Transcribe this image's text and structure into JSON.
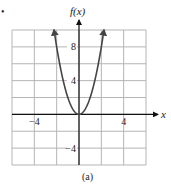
{
  "chart_data": {
    "type": "line",
    "title": "",
    "caption": "(a)",
    "xlabel": "x",
    "ylabel": "f(x)",
    "function": "f(x) = 2x^2",
    "xlim": [
      -6,
      6
    ],
    "ylim": [
      -6,
      10
    ],
    "grid": true,
    "grid_step_x": 2,
    "grid_step_y": 2,
    "x_tick_labels": [
      {
        "value": -4,
        "label": "−4"
      },
      {
        "value": 4,
        "label": "4"
      }
    ],
    "y_tick_labels": [
      {
        "value": 8,
        "label": "8"
      },
      {
        "value": 4,
        "label": "4"
      },
      {
        "value": -4,
        "label": "−4"
      }
    ],
    "series": [
      {
        "name": "f(x)",
        "x": [
          -2.24,
          -2,
          -1.5,
          -1,
          -0.5,
          0,
          0.5,
          1,
          1.5,
          2,
          2.24
        ],
        "y": [
          10,
          8,
          4.5,
          2,
          0.5,
          0,
          0.5,
          2,
          4.5,
          8,
          10
        ],
        "arrows_at_ends": true
      }
    ],
    "colors": {
      "curve": "#444444",
      "axes": "#111111",
      "grid": "#b5b5b5"
    }
  },
  "marker_dot": "•"
}
